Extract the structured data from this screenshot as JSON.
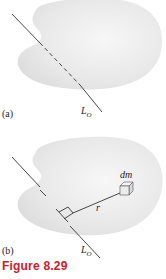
{
  "figure": {
    "caption": "Figure 8.29",
    "caption_color": "#c8202a",
    "panels": [
      {
        "label": "(a)",
        "axis_label": "L",
        "axis_subscript": "O"
      },
      {
        "label": "(b)",
        "axis_label": "L",
        "axis_subscript": "O",
        "mass_element_label": "dm",
        "distance_label": "r"
      }
    ],
    "colors": {
      "body_fill": "#e6e6e6",
      "line": "#333333"
    }
  }
}
